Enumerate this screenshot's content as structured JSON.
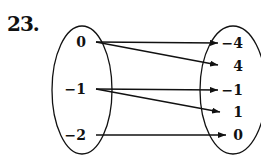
{
  "problem_number": "23.",
  "domain_set": {
    "values": [
      "0",
      "−1",
      "−2"
    ]
  },
  "range_set": {
    "values": [
      "−4",
      "4",
      "−1",
      "1",
      "0"
    ]
  },
  "mappings": [
    {
      "from": "0",
      "to": "−4"
    },
    {
      "from": "0",
      "to": "4"
    },
    {
      "from": "−1",
      "to": "−1"
    },
    {
      "from": "−1",
      "to": "1"
    },
    {
      "from": "−2",
      "to": "0"
    }
  ],
  "colors": {
    "ink": "#111111",
    "background": "#ffffff"
  }
}
